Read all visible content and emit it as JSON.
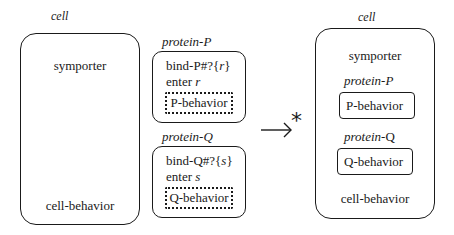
{
  "left": {
    "cell_label": "cell",
    "symporter": "symporter",
    "cell_behavior": "cell-behavior"
  },
  "middle": {
    "protein_p": {
      "label": "protein-P",
      "line1_prefix": "bind-P#?{",
      "line1_var": "r",
      "line1_suffix": "}",
      "line2_prefix": "enter ",
      "line2_var": "r",
      "behavior": "P-behavior"
    },
    "protein_q": {
      "label": "protein-Q",
      "line1_prefix": "bind-Q#?{",
      "line1_var": "s",
      "line1_suffix": "}",
      "line2_prefix": "enter ",
      "line2_var": "s",
      "behavior": "Q-behavior"
    }
  },
  "arrow": {
    "symbol": "→",
    "star": "*"
  },
  "right": {
    "cell_label": "cell",
    "symporter": "symporter",
    "protein_p_label_prefix": "protein-",
    "protein_p_label_suffix": "P",
    "p_behavior": "P-behavior",
    "protein_q_label_prefix": "protein-",
    "protein_q_label_suffix": "Q",
    "q_behavior": "Q-behavior",
    "cell_behavior": "cell-behavior"
  }
}
